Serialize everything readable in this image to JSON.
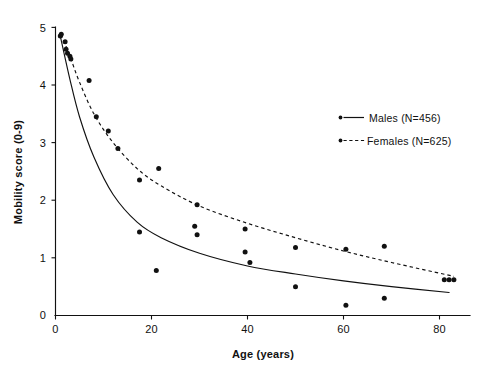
{
  "chart_data": {
    "type": "scatter",
    "title": "",
    "xlabel": "Age (years)",
    "ylabel": "Mobility score (0-9)",
    "xlim": [
      0,
      86
    ],
    "ylim": [
      0,
      5
    ],
    "xticks": [
      0,
      20,
      40,
      60,
      80
    ],
    "yticks": [
      0,
      1,
      2,
      3,
      4,
      5
    ],
    "xtick_labels": [
      "0",
      "20",
      "40",
      "60",
      "80"
    ],
    "ytick_labels": [
      "0",
      "1",
      "2",
      "3",
      "4",
      "5"
    ],
    "grid": false,
    "legend_position": "upper right",
    "series": [
      {
        "name": "Males (N=456)",
        "label": "Males (N=456)",
        "n": 456,
        "marker": "dot",
        "linestyle": "solid",
        "color": "#111111",
        "points": [
          {
            "x": 1.0,
            "y": 4.85
          },
          {
            "x": 2.0,
            "y": 4.75
          },
          {
            "x": 2.5,
            "y": 4.55
          },
          {
            "x": 3.0,
            "y": 4.5
          },
          {
            "x": 17.5,
            "y": 1.45
          },
          {
            "x": 21.0,
            "y": 0.78
          },
          {
            "x": 29.0,
            "y": 1.55
          },
          {
            "x": 29.5,
            "y": 1.4
          },
          {
            "x": 39.5,
            "y": 1.1
          },
          {
            "x": 40.5,
            "y": 0.92
          },
          {
            "x": 50.0,
            "y": 0.5
          },
          {
            "x": 60.5,
            "y": 0.18
          },
          {
            "x": 68.5,
            "y": 0.3
          },
          {
            "x": 82.0,
            "y": 0.62
          }
        ],
        "fit_curve": [
          {
            "x": 1.0,
            "y": 4.85
          },
          {
            "x": 3.0,
            "y": 4.1
          },
          {
            "x": 5.0,
            "y": 3.45
          },
          {
            "x": 8.0,
            "y": 2.75
          },
          {
            "x": 12.0,
            "y": 2.1
          },
          {
            "x": 17.0,
            "y": 1.62
          },
          {
            "x": 22.0,
            "y": 1.35
          },
          {
            "x": 30.0,
            "y": 1.08
          },
          {
            "x": 40.0,
            "y": 0.86
          },
          {
            "x": 50.0,
            "y": 0.72
          },
          {
            "x": 60.0,
            "y": 0.6
          },
          {
            "x": 70.0,
            "y": 0.5
          },
          {
            "x": 82.0,
            "y": 0.4
          }
        ]
      },
      {
        "name": "Females (N=625)",
        "label": "Females (N=625)",
        "n": 625,
        "marker": "dot",
        "linestyle": "dashed",
        "color": "#111111",
        "points": [
          {
            "x": 1.2,
            "y": 4.88
          },
          {
            "x": 2.2,
            "y": 4.62
          },
          {
            "x": 3.2,
            "y": 4.45
          },
          {
            "x": 7.0,
            "y": 4.08
          },
          {
            "x": 8.5,
            "y": 3.45
          },
          {
            "x": 11.0,
            "y": 3.2
          },
          {
            "x": 13.0,
            "y": 2.9
          },
          {
            "x": 17.5,
            "y": 2.35
          },
          {
            "x": 21.5,
            "y": 2.55
          },
          {
            "x": 29.5,
            "y": 1.92
          },
          {
            "x": 39.5,
            "y": 1.5
          },
          {
            "x": 50.0,
            "y": 1.18
          },
          {
            "x": 60.5,
            "y": 1.15
          },
          {
            "x": 68.5,
            "y": 1.2
          },
          {
            "x": 81.0,
            "y": 0.62
          },
          {
            "x": 83.0,
            "y": 0.62
          }
        ],
        "fit_curve": [
          {
            "x": 1.2,
            "y": 4.88
          },
          {
            "x": 3.0,
            "y": 4.5
          },
          {
            "x": 5.0,
            "y": 4.05
          },
          {
            "x": 8.0,
            "y": 3.5
          },
          {
            "x": 12.0,
            "y": 3.0
          },
          {
            "x": 17.0,
            "y": 2.55
          },
          {
            "x": 22.0,
            "y": 2.25
          },
          {
            "x": 30.0,
            "y": 1.9
          },
          {
            "x": 40.0,
            "y": 1.6
          },
          {
            "x": 50.0,
            "y": 1.35
          },
          {
            "x": 60.0,
            "y": 1.12
          },
          {
            "x": 70.0,
            "y": 0.92
          },
          {
            "x": 83.0,
            "y": 0.68
          }
        ]
      }
    ]
  },
  "legend": {
    "males_label": "Males (N=456)",
    "females_label": "Females (N=625)"
  },
  "axes": {
    "x_title": "Age (years)",
    "y_title": "Mobility score (0-9)"
  }
}
